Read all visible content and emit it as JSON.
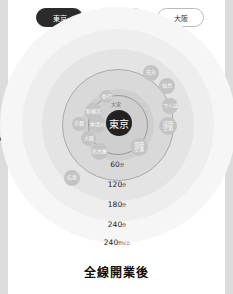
{
  "tabs": [
    {
      "label": "東京",
      "active": true
    },
    {
      "label": "名古屋",
      "active": false
    },
    {
      "label": "大阪",
      "active": false
    }
  ],
  "center_station": "東京",
  "rings": [
    {
      "label": "60",
      "unit": "分"
    },
    {
      "label": "120",
      "unit": "分"
    },
    {
      "label": "180",
      "unit": "分"
    },
    {
      "label": "240",
      "unit": "分"
    },
    {
      "label": "240",
      "unit": "分以上"
    }
  ],
  "stations": [
    {
      "name": "日光"
    },
    {
      "name": "仙台"
    },
    {
      "name": "つくば"
    },
    {
      "name": "成田\n空港"
    },
    {
      "name": "羽田\n空港"
    },
    {
      "name": "大宮"
    },
    {
      "name": "新行"
    },
    {
      "name": "新横浜"
    },
    {
      "name": "京都"
    },
    {
      "name": "中津川"
    },
    {
      "name": "大阪"
    },
    {
      "name": "名古屋"
    },
    {
      "name": "広島"
    }
  ],
  "caption": "全線開業後",
  "colors": {
    "active_tab": "#2b2b2b",
    "center": "#222222",
    "station": "#c4c4c4"
  }
}
